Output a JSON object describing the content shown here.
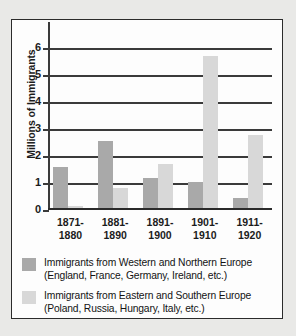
{
  "chart_data": {
    "type": "bar",
    "title": "",
    "xlabel": "",
    "ylabel": "Millions of Immigrants",
    "ylim": [
      0,
      6.6
    ],
    "yticks": [
      0,
      1,
      2,
      3,
      4,
      5,
      6
    ],
    "ytick_labels": [
      "0",
      "1",
      "2",
      "3",
      "4",
      "5",
      "6"
    ],
    "grid": true,
    "legend_position": "below",
    "categories": [
      "1871-1880",
      "1881-1890",
      "1891-1900",
      "1901-1910",
      "1911-1920"
    ],
    "category_lines": [
      [
        "1871-",
        "1880"
      ],
      [
        "1881-",
        "1890"
      ],
      [
        "1891-",
        "1900"
      ],
      [
        "1901-",
        "1910"
      ],
      [
        "1911-",
        "1920"
      ]
    ],
    "series": [
      {
        "name": "Immigrants from Western and Northern Europe (England, France, Germany, Ireland, etc.)",
        "short_name": "Western and Northern Europe",
        "color": "#a9a9a9",
        "values": [
          1.6,
          2.55,
          1.2,
          1.05,
          0.45
        ]
      },
      {
        "name": "Immigrants from Eastern and Southern Europe (Poland, Russia, Hungary, Italy, etc.)",
        "short_name": "Eastern and Southern Europe",
        "color": "#d8d8d8",
        "values": [
          0.15,
          0.8,
          1.7,
          5.7,
          2.8
        ]
      }
    ]
  },
  "legend": {
    "entries": [
      {
        "line1": "Immigrants from Western and Northern Europe",
        "line2": "(England, France, Germany, Ireland, etc.)",
        "color": "#a9a9a9"
      },
      {
        "line1": "Immigrants from Eastern and Southern Europe",
        "line2": "(Poland, Russia, Hungary, Italy, etc.)",
        "color": "#d8d8d8"
      }
    ]
  }
}
